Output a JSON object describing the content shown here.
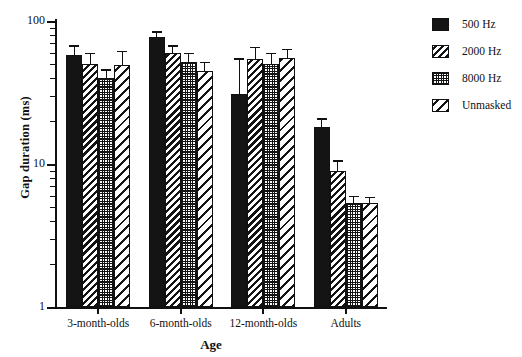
{
  "chart_data": {
    "type": "bar",
    "title": "",
    "xlabel": "Age",
    "ylabel": "Gap duration (ms)",
    "yscale": "log",
    "ylim": [
      1,
      100
    ],
    "ytick_labels": [
      "100",
      "10",
      "1"
    ],
    "ytick_values": [
      100,
      10,
      1
    ],
    "grid": false,
    "legend_position": "right",
    "categories": [
      "3-month-olds",
      "6-month-olds",
      "12-month-olds",
      "Adults"
    ],
    "series": [
      {
        "name": "500 Hz",
        "pattern": "solid",
        "values": [
          58,
          77,
          31,
          18
        ],
        "err_upper": [
          68,
          85,
          55,
          21
        ],
        "err_lower": [
          58,
          77,
          31,
          18
        ]
      },
      {
        "name": "2000 Hz",
        "pattern": "dense-hatch",
        "values": [
          50,
          60,
          54,
          9
        ],
        "err_upper": [
          60,
          68,
          66,
          10.6
        ],
        "err_lower": [
          50,
          60,
          54,
          9
        ]
      },
      {
        "name": "8000 Hz",
        "pattern": "dots",
        "values": [
          40,
          52,
          50,
          5.3
        ],
        "err_upper": [
          46,
          60,
          60,
          6.0
        ],
        "err_lower": [
          40,
          52,
          50,
          5.3
        ]
      },
      {
        "name": "Unmasked",
        "pattern": "sparse-hatch",
        "values": [
          49,
          45,
          55,
          5.3
        ],
        "err_upper": [
          62,
          52,
          64,
          5.9
        ],
        "err_lower": [
          49,
          45,
          55,
          5.3
        ]
      }
    ]
  },
  "legend": {
    "items": [
      {
        "label": "500 Hz",
        "pattern": "solid"
      },
      {
        "label": "2000 Hz",
        "pattern": "dense-hatch"
      },
      {
        "label": "8000 Hz",
        "pattern": "dots"
      },
      {
        "label": "Unmasked",
        "pattern": "sparse-hatch"
      }
    ]
  },
  "axes": {
    "y_title": "Gap duration (ms)",
    "x_title": "Age"
  },
  "colors": {
    "ink": "#141414",
    "background": "#ffffff"
  }
}
